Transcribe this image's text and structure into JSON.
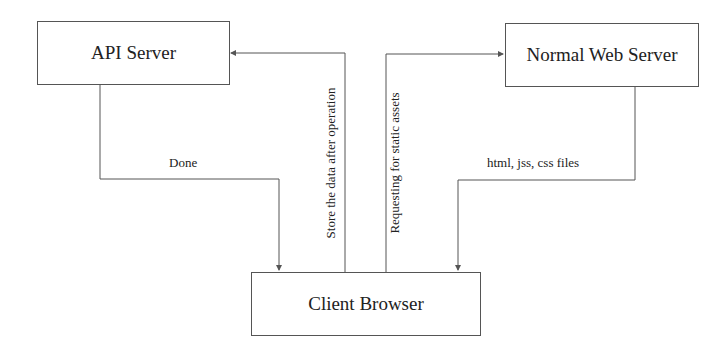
{
  "nodes": {
    "api_server": {
      "label": "API Server"
    },
    "normal_web_server": {
      "label": "Normal Web Server"
    },
    "client_browser": {
      "label": "Client Browser"
    }
  },
  "edges": {
    "done": {
      "from": "API Server",
      "to": "Client Browser",
      "label": "Done"
    },
    "store": {
      "from": "Client Browser",
      "to": "API Server",
      "label": "Store the data after operation"
    },
    "requesting": {
      "from": "Client Browser",
      "to": "Normal Web Server",
      "label": "Requesting for static assets"
    },
    "files": {
      "from": "Normal Web Server",
      "to": "Client Browser",
      "label": "html, jss, css files"
    }
  },
  "colors": {
    "line": "#555555",
    "text": "#222222",
    "background": "#ffffff"
  }
}
